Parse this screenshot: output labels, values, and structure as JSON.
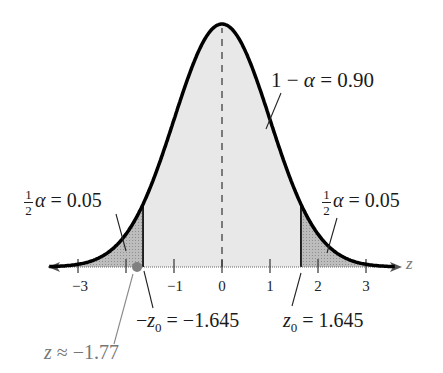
{
  "chart_data": {
    "type": "area",
    "title": "",
    "xlabel": "z",
    "ylabel": "",
    "distribution": "standard normal",
    "xlim": [
      -3.6,
      3.6
    ],
    "x_ticks": [
      -3,
      -1,
      0,
      1,
      2,
      3
    ],
    "x_tick_labels": [
      "−3",
      "−1",
      "0",
      "1",
      "2",
      "3"
    ],
    "shaded_regions": [
      {
        "name": "left tail",
        "from": -3.6,
        "to": -1.645,
        "area": 0.05,
        "label": "½α = 0.05"
      },
      {
        "name": "center",
        "from": -1.645,
        "to": 1.645,
        "area": 0.9,
        "label": "1 − α = 0.90"
      },
      {
        "name": "right tail",
        "from": 1.645,
        "to": 3.6,
        "area": 0.05,
        "label": "½α = 0.05"
      }
    ],
    "critical_values": [
      {
        "label": "−z0 = −1.645",
        "value": -1.645
      },
      {
        "label": "z0 = 1.645",
        "value": 1.645
      }
    ],
    "test_statistic": {
      "label": "z ≈ −1.77",
      "value": -1.77
    },
    "mean_line": {
      "x": 0,
      "style": "dashed"
    },
    "grid": false,
    "legend": "none"
  },
  "labels": {
    "center_area": {
      "lhs": "1 − ",
      "alpha": "α",
      "rhs": " = 0.90"
    },
    "left_tail": {
      "num": "1",
      "den": "2",
      "alpha": "α",
      "rhs": " = 0.05"
    },
    "right_tail": {
      "num": "1",
      "den": "2",
      "alpha": "α",
      "rhs": " = 0.05"
    },
    "neg_z0": {
      "sign": "−",
      "z": "z",
      "sub": "0",
      "rhs": " = −1.645"
    },
    "pos_z0": {
      "z": "z",
      "sub": "0",
      "rhs": " = 1.645"
    },
    "test_stat": {
      "z": "z",
      "rhs": " ≈ −1.77"
    },
    "axis_var": "z"
  },
  "colors": {
    "curve": "#000000",
    "center_fill": "#e8e8e8",
    "tail_fill": "#b5b5b5",
    "stat_point": "#808080"
  }
}
